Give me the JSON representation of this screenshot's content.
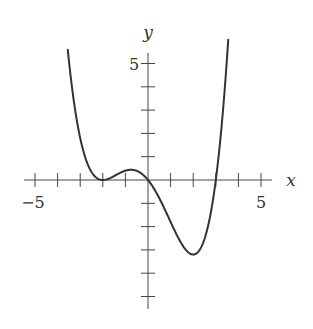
{
  "chart_data": {
    "type": "line",
    "title": "",
    "xlabel": "x",
    "ylabel": "y",
    "xlim": [
      -5.5,
      5.5
    ],
    "ylim": [
      -5.5,
      5.5
    ],
    "grid": false,
    "legend": null,
    "x_tick_values": [
      -5,
      -4,
      -3,
      -2,
      -1,
      0,
      1,
      2,
      3,
      4,
      5
    ],
    "y_tick_values": [
      -5,
      -4,
      -3,
      -2,
      -1,
      0,
      1,
      2,
      3,
      4,
      5
    ],
    "x_tick_labels": [
      {
        "value": -5,
        "label": "−5"
      },
      {
        "value": 5,
        "label": "5"
      }
    ],
    "y_tick_labels": [
      {
        "value": 5,
        "label": "5"
      }
    ],
    "function_description": "Quartic polynomial ≈ 0.1·x·(x+2)²·(x−3); double root at x=−2, roots at x=0 and x=3, local max ≈ (−1, 0.4), minimum ≈ (2, −3.3)",
    "series": [
      {
        "name": "f(x)",
        "x": [
          -3.55,
          -3.25,
          -3.0,
          -2.75,
          -2.5,
          -2.25,
          -2.0,
          -1.75,
          -1.5,
          -1.25,
          -1.0,
          -0.75,
          -0.5,
          -0.25,
          0.0,
          0.25,
          0.5,
          0.75,
          1.0,
          1.25,
          1.5,
          1.75,
          2.0,
          2.25,
          2.5,
          2.75,
          3.0,
          3.25,
          3.55
        ],
        "y": [
          5.6,
          3.7,
          2.4,
          1.5,
          0.78,
          0.33,
          0.0,
          0.07,
          0.23,
          0.37,
          0.4,
          0.36,
          0.26,
          0.12,
          0.0,
          -0.39,
          -0.78,
          -1.36,
          -1.8,
          -2.37,
          -2.82,
          -3.18,
          -3.2,
          -3.3,
          -2.81,
          -1.86,
          0.0,
          1.13,
          5.6
        ]
      }
    ]
  },
  "labels": {
    "x_axis_name": "x",
    "y_axis_name": "y",
    "x_neg5": "−5",
    "x_pos5": "5",
    "y_pos5": "5"
  }
}
